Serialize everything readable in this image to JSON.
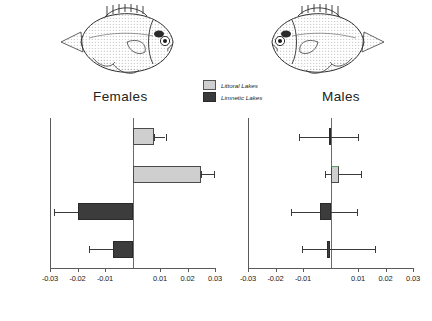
{
  "figure": {
    "legend": {
      "items": [
        {
          "key": "littoral",
          "label": "Littoral Lakes",
          "color": "#cfcfcf"
        },
        {
          "key": "limnetic",
          "label": "Limnetic Lakes",
          "color": "#3c3c3c"
        }
      ]
    },
    "illustrations": [
      {
        "name": "female-sunfish-illustration",
        "facing": "right"
      },
      {
        "name": "male-sunfish-illustration",
        "facing": "left"
      }
    ]
  },
  "chart_data": [
    {
      "type": "bar",
      "orientation": "horizontal",
      "title": "Females",
      "xlabel": "",
      "ylabel": "",
      "xlim": [
        -0.03,
        0.03
      ],
      "grid": false,
      "zero_line": 0,
      "categories": [
        "Five",
        "Ottawa",
        "Green",
        "Horn"
      ],
      "ticks": [
        -0.03,
        -0.02,
        -0.01,
        0.01,
        0.02,
        0.03
      ],
      "ticklabels": [
        "-0.03",
        "-0.02",
        "-0.01",
        "0.01",
        "0.02",
        "0.03"
      ],
      "series": [
        {
          "name": "value",
          "values": [
            0.0078,
            0.025,
            -0.02,
            -0.007
          ],
          "groups": [
            "littoral",
            "littoral",
            "limnetic",
            "limnetic"
          ],
          "err_low": [
            0.0078,
            0.025,
            -0.0285,
            -0.016
          ],
          "err_high": [
            0.012,
            0.0295,
            -0.02,
            -0.007
          ]
        }
      ]
    },
    {
      "type": "bar",
      "orientation": "horizontal",
      "title": "Males",
      "xlabel": "",
      "ylabel": "",
      "xlim": [
        -0.03,
        0.03
      ],
      "grid": false,
      "zero_line": 0,
      "categories": [
        "Five",
        "Ottawa",
        "Green",
        "Horn"
      ],
      "ticks": [
        -0.03,
        -0.02,
        -0.01,
        0.01,
        0.02,
        0.03
      ],
      "ticklabels": [
        "-0.03",
        "-0.02",
        "-0.01",
        "0.01",
        "0.02",
        "0.03"
      ],
      "series": [
        {
          "name": "value",
          "values": [
            -0.0005,
            0.003,
            -0.004,
            -0.0012
          ],
          "groups": [
            "limnetic",
            "littoral",
            "limnetic",
            "limnetic"
          ],
          "err_low": [
            -0.0115,
            -0.002,
            -0.0145,
            -0.0105
          ],
          "err_high": [
            0.01,
            0.011,
            0.0095,
            0.016
          ]
        }
      ]
    }
  ]
}
